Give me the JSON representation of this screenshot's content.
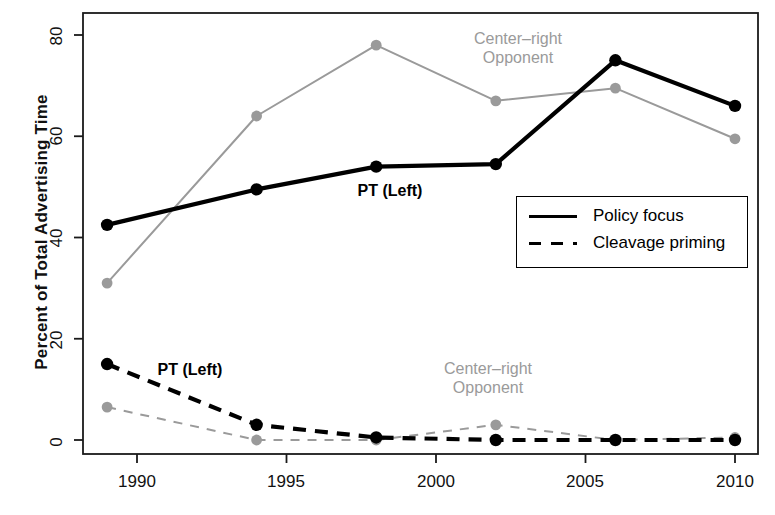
{
  "chart_data": {
    "type": "line",
    "title": "",
    "xlabel": "",
    "ylabel": "Percent of Total Advertising Time",
    "xlim": [
      1988,
      2011
    ],
    "ylim": [
      -2,
      84
    ],
    "x": [
      1989,
      1994,
      1998,
      2002,
      2006,
      2010
    ],
    "xticks": [
      "1990",
      "1995",
      "2000",
      "2005",
      "2010"
    ],
    "xtick_values": [
      1990,
      1995,
      2000,
      2005,
      2010
    ],
    "yticks": [
      "0",
      "20",
      "40",
      "60",
      "80"
    ],
    "ytick_values": [
      0,
      20,
      40,
      60,
      80
    ],
    "grid": false,
    "legend_position": "center-right-inside",
    "series": [
      {
        "name": "PT (Left) — Policy focus",
        "actor": "PT (Left)",
        "measure": "Policy focus",
        "style": "solid",
        "color": "#000000",
        "values": [
          42.5,
          49.5,
          54.0,
          54.5,
          75.0,
          66.0
        ]
      },
      {
        "name": "Center–right Opponent — Policy focus",
        "actor": "Center–right Opponent",
        "measure": "Policy focus",
        "style": "solid",
        "color": "#9a9a9a",
        "values": [
          31.0,
          64.0,
          78.0,
          67.0,
          69.5,
          59.5
        ]
      },
      {
        "name": "PT (Left) — Cleavage priming",
        "actor": "PT (Left)",
        "measure": "Cleavage priming",
        "style": "dashed",
        "color": "#000000",
        "values": [
          15.0,
          3.0,
          0.5,
          0.0,
          0.0,
          0.0
        ]
      },
      {
        "name": "Center–right Opponent — Cleavage priming",
        "actor": "Center–right Opponent",
        "measure": "Cleavage priming",
        "style": "dashed",
        "color": "#9a9a9a",
        "values": [
          6.5,
          0.0,
          0.0,
          3.0,
          0.0,
          0.5
        ]
      }
    ],
    "annotations": [
      {
        "text": "Center–right\nOpponent",
        "line1": "Center–right",
        "line2": "Opponent",
        "color": "#9a9a9a",
        "near": "policy-focus-gray"
      },
      {
        "text": "PT (Left)",
        "line1": "PT (Left)",
        "color": "#000000",
        "near": "policy-focus-black"
      },
      {
        "text": "PT (Left)",
        "line1": "PT (Left)",
        "color": "#000000",
        "near": "cleavage-priming-black"
      },
      {
        "text": "Center–right\nOpponent",
        "line1": "Center–right",
        "line2": "Opponent",
        "color": "#9a9a9a",
        "near": "cleavage-priming-gray"
      }
    ],
    "legend": {
      "entries": [
        {
          "label": "Policy focus",
          "style": "solid",
          "color": "#000000"
        },
        {
          "label": "Cleavage priming",
          "style": "dashed",
          "color": "#000000"
        }
      ]
    }
  },
  "colors": {
    "black": "#000000",
    "gray": "#9a9a9a",
    "axis": "#1a1a1a",
    "background": "#ffffff"
  }
}
